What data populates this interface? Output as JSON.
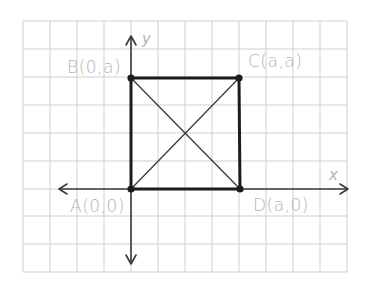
{
  "diagram": {
    "type": "coordinate-plane-square",
    "axes": {
      "x_label": "x",
      "y_label": "y"
    },
    "points": {
      "A": {
        "label": "A(0,0)",
        "coords": "(0,0)"
      },
      "B": {
        "label": "B(0,a)",
        "coords": "(0,a)"
      },
      "C": {
        "label": "C(a,a)",
        "coords": "(a,a)"
      },
      "D": {
        "label": "D(a,0)",
        "coords": "(a,0)"
      }
    },
    "segments": [
      "AB",
      "BC",
      "CD",
      "DA",
      "AC",
      "BD"
    ],
    "colors": {
      "grid": "#cfcfcf",
      "axis": "#3a3a3a",
      "square": "#1c1c1c",
      "label": "#b4b4b4"
    }
  }
}
